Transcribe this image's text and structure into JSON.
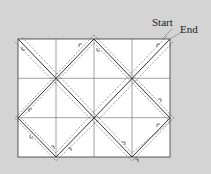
{
  "labels": {
    "start": "Start",
    "end": "End"
  },
  "grid": {
    "columns": 4,
    "rows": 3,
    "left": 18,
    "top": 39,
    "cell_width": 38,
    "cell_height": 39.33
  },
  "path": {
    "description": "Diagonal zigzag path bouncing between grid edges, drawn with solid center line and dashed offset lines",
    "vertices": [
      [
        170,
        39
      ],
      [
        94,
        118
      ],
      [
        56,
        157
      ],
      [
        18,
        118
      ],
      [
        94,
        39
      ],
      [
        170,
        118
      ],
      [
        132,
        157
      ],
      [
        18,
        39
      ]
    ]
  },
  "colors": {
    "background": "#d4d4d4",
    "grid_fill": "#ffffff",
    "line": "#333333"
  }
}
